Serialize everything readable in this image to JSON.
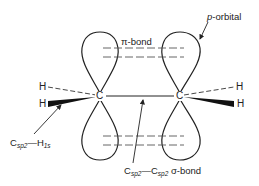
{
  "diagram": {
    "title": "",
    "colors": {
      "ink": "#222222",
      "background": "#ffffff"
    },
    "atoms": {
      "carbon_left": "C",
      "carbon_right": "C",
      "h_left_top": "H",
      "h_left_bottom": "H",
      "h_right_top": "H",
      "h_right_bottom": "H"
    },
    "labels": {
      "p_orbital": {
        "prefix": "p",
        "rest": "-orbital"
      },
      "pi_bond": "π-bond",
      "c_h_bond": {
        "c": "C",
        "c_sub": "sp",
        "c_sup": "2",
        "dash": "—",
        "h": "H",
        "h_sub": "1s"
      },
      "sigma_bond": {
        "c1": "C",
        "c1_sub": "sp",
        "c1_sup": "2",
        "dash": "—",
        "c2": "C",
        "c2_sub": "sp",
        "c2_sup": "2",
        "rest": " σ-bond"
      }
    }
  }
}
